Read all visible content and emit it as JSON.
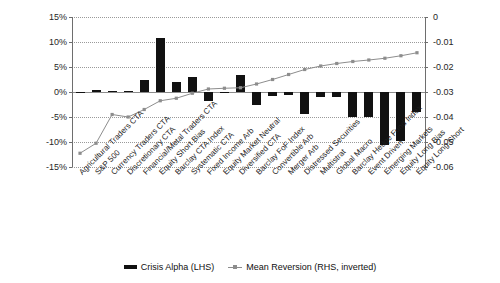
{
  "chart_data": {
    "type": "bar",
    "title": "",
    "subtitle": "",
    "xlabel": "",
    "ylabel": "",
    "grid": true,
    "legend_position": "bottom",
    "categories": [
      "Agricultural Traders CTA",
      "S&P 500",
      "Currency Traders CTA",
      "Discretionary CTA",
      "Financial/Metal Traders CTA",
      "Equity Short Bias",
      "Barclay CTA Index",
      "Systematic CTA",
      "Fixed Income Arb",
      "Equity Market Neutral",
      "Diversified CTA",
      "Barclay FoF Index",
      "Convertible Arb",
      "Merger Arb",
      "Distressed Securities",
      "Multistrat",
      "Global Macro",
      "Barclay Hedge Fund Index",
      "Event Driven",
      "Emerging Markets",
      "Equity Long Bias",
      "Equity Long Short"
    ],
    "series": [
      {
        "name": "Crisis Alpha (LHS)",
        "axis": "left",
        "kind": "bar",
        "color": "#111111",
        "values": [
          0.0,
          0.4,
          0.2,
          0.15,
          2.5,
          10.8,
          2.1,
          3.0,
          -1.8,
          0.0,
          3.5,
          -2.5,
          -0.8,
          -0.6,
          -4.3,
          -1.0,
          -1.0,
          -5.0,
          -5.0,
          -10.5,
          -9.8,
          -4.0
        ]
      },
      {
        "name": "Mean Reversion (RHS, inverted)",
        "axis": "right",
        "kind": "line",
        "color": "#8d8d8d",
        "values": [
          -0.0545,
          -0.0505,
          -0.039,
          -0.04,
          -0.037,
          -0.0335,
          -0.0325,
          -0.0305,
          -0.0288,
          -0.0285,
          -0.0283,
          -0.0268,
          -0.025,
          -0.023,
          -0.021,
          -0.0196,
          -0.0186,
          -0.0178,
          -0.0172,
          -0.0165,
          -0.0155,
          -0.0143
        ]
      }
    ],
    "yaxis_left": {
      "min": -15,
      "max": 15,
      "ticks": [
        "15%",
        "10%",
        "5%",
        "0%",
        "-5%",
        "-10%",
        "-15%"
      ],
      "tick_values": [
        15,
        10,
        5,
        0,
        -5,
        -10,
        -15
      ],
      "suffix": "%"
    },
    "yaxis_right": {
      "min": -0.06,
      "max": 0,
      "inverted": true,
      "ticks": [
        "-0.06",
        "-0.05",
        "-0.04",
        "-0.03",
        "-0.02",
        "-0.01",
        "0"
      ],
      "tick_values": [
        -0.06,
        -0.05,
        -0.04,
        -0.03,
        -0.02,
        -0.01,
        0
      ]
    },
    "legend": [
      {
        "label": "Crisis Alpha (LHS)",
        "marker": "bar",
        "color": "#111111"
      },
      {
        "label": "Mean Reversion (RHS, inverted)",
        "marker": "line",
        "color": "#8d8d8d"
      }
    ]
  }
}
